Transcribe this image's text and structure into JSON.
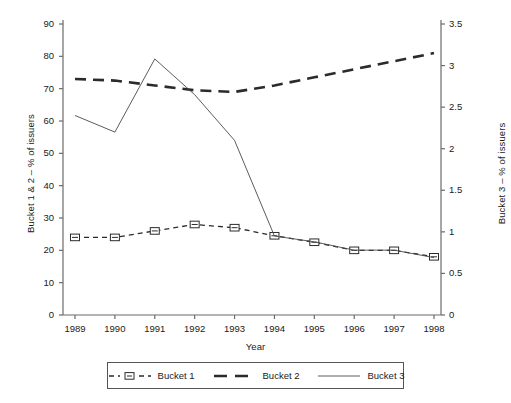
{
  "chart_data": {
    "type": "line",
    "title": "",
    "xlabel": "Year",
    "ylabel": "Bucket 1 & 2 – % of issuers",
    "ylabel_right": "Bucket 3 – % of issuers",
    "categories": [
      "1989",
      "1990",
      "1991",
      "1992",
      "1993",
      "1994",
      "1995",
      "1996",
      "1997",
      "1998"
    ],
    "ylim": [
      0,
      90
    ],
    "ylim_right": [
      0,
      3.5
    ],
    "yticks": [
      "0",
      "10",
      "20",
      "30",
      "40",
      "50",
      "60",
      "70",
      "80",
      "90"
    ],
    "yticks_right": [
      "0",
      "0.5",
      "1",
      "1.5",
      "2",
      "2.5",
      "3",
      "3.5"
    ],
    "grid": false,
    "legend_position": "bottom",
    "series": [
      {
        "name": "Bucket 1",
        "axis": "left",
        "style": "dashed-marker",
        "marker": "square",
        "color": "#2b2b2b",
        "values": [
          24,
          24,
          26,
          28,
          27,
          24.5,
          22.5,
          20,
          20,
          18
        ]
      },
      {
        "name": "Bucket 2",
        "axis": "left",
        "style": "thick-dashed",
        "marker": "none",
        "color": "#2b2b2b",
        "values": [
          73,
          72.5,
          71,
          69.5,
          69,
          71,
          73.5,
          76,
          78.5,
          81
        ]
      },
      {
        "name": "Bucket 3",
        "axis": "right",
        "style": "thin-solid",
        "marker": "none",
        "color": "#4a4a4a",
        "values": [
          2.4,
          2.2,
          3.08,
          2.65,
          2.1,
          0.95,
          0.88,
          0.78,
          0.78,
          0.69
        ]
      }
    ]
  },
  "legend": {
    "items": [
      {
        "label": "Bucket 1"
      },
      {
        "label": "Bucket 2"
      },
      {
        "label": "Bucket 3"
      }
    ]
  }
}
